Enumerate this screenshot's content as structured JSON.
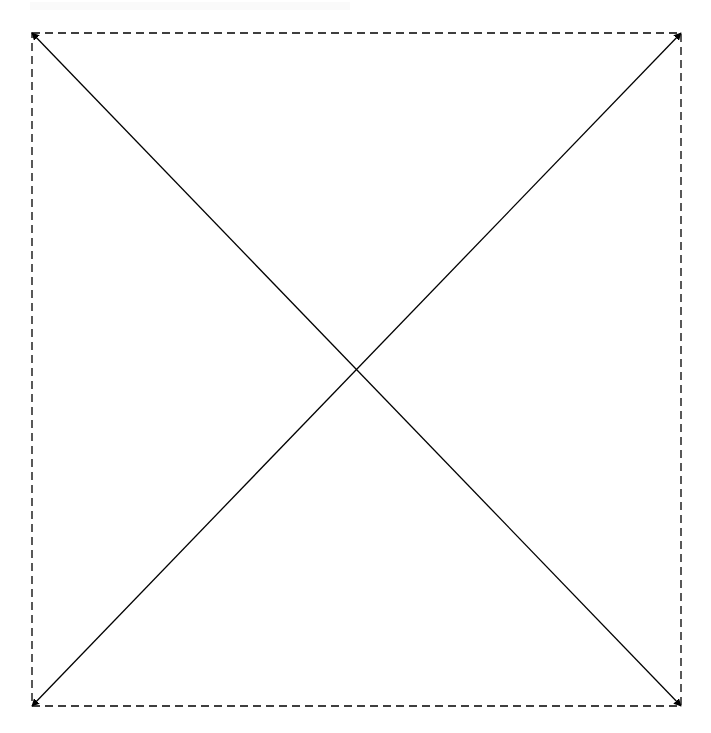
{
  "canvas": {
    "width": 711,
    "height": 733,
    "background": "#ffffff"
  },
  "header": {
    "faint_text": ""
  },
  "diagram": {
    "type": "placeholder-x-box",
    "box": {
      "x1": 32,
      "y1": 33,
      "x2": 681,
      "y2": 706,
      "stroke": "#000000",
      "stroke_width": 1.3,
      "dash": "8 5"
    },
    "diagonals": [
      {
        "name": "top-left-to-bottom-right",
        "from": [
          32,
          33
        ],
        "to": [
          681,
          706
        ],
        "arrowheads": "both"
      },
      {
        "name": "bottom-left-to-top-right",
        "from": [
          32,
          706
        ],
        "to": [
          681,
          33
        ],
        "arrowheads": "both"
      }
    ],
    "intersection": [
      356,
      369
    ],
    "line_color": "#000000"
  }
}
